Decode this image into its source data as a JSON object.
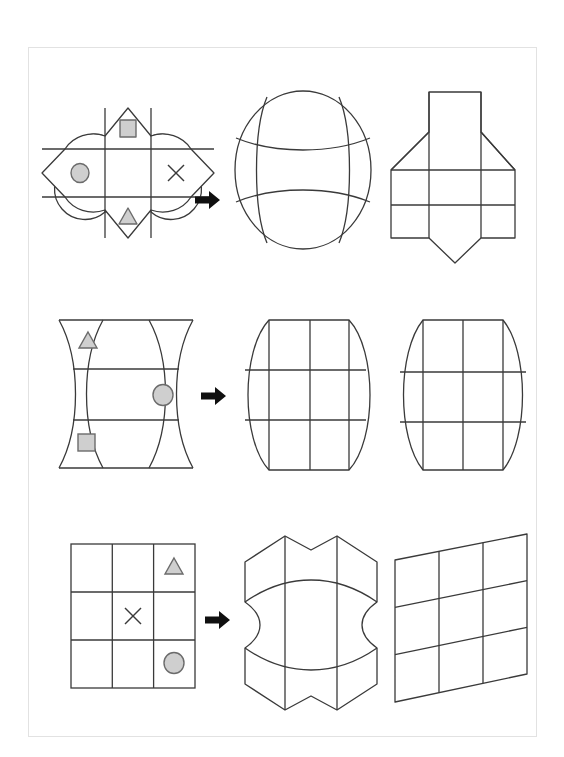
{
  "page": {
    "type": "spatial-reasoning-worksheet",
    "background_color": "#ffffff",
    "sheet_border_color": "#e2e2e2",
    "line_color": "#3a3a3a",
    "symbol_fill_color": "#cfcfcf",
    "symbol_stroke_color": "#6b6b6b",
    "arrow_color": "#101010",
    "row_count": 3,
    "figures_per_row": 3
  },
  "rows": [
    {
      "id": "row-1",
      "net": {
        "name": "four-petal-flower-net",
        "shape_description": "cross net with four rounded petal flaps and pointed top/bottom/left/right tips",
        "grid": "3x3 with rounded outer cells",
        "symbols": [
          {
            "name": "symbol-square",
            "glyph": "square",
            "cell": "top-center",
            "fill": "#cfcfcf"
          },
          {
            "name": "symbol-circle",
            "glyph": "circle",
            "cell": "middle-left",
            "fill": "#cfcfcf"
          },
          {
            "name": "symbol-x",
            "glyph": "x",
            "cell": "middle-right",
            "fill": "none"
          },
          {
            "name": "symbol-triangle",
            "glyph": "triangle",
            "cell": "bottom-center",
            "fill": "#cfcfcf"
          }
        ]
      },
      "arrow": {
        "name": "row1-arrow-icon",
        "direction": "right"
      },
      "options": [
        {
          "label": "A",
          "name": "sphere-ball-figure",
          "shape_description": "ellipse sphere with two vertical and two horizontal curved seams"
        },
        {
          "label": "B",
          "name": "angular-solid-figure",
          "shape_description": "angular polygon solid with vertical column, flared shoulders and pointed base"
        }
      ]
    },
    {
      "id": "row-2",
      "net": {
        "name": "hourglass-curved-net",
        "shape_description": "net of four curved vertical panels pinched at the waist, straight top and bottom edges",
        "grid": "3x3 curved panels",
        "symbols": [
          {
            "name": "symbol-triangle",
            "glyph": "triangle",
            "cell": "top-left",
            "fill": "#cfcfcf"
          },
          {
            "name": "symbol-circle",
            "glyph": "circle",
            "cell": "middle-right",
            "fill": "#cfcfcf"
          },
          {
            "name": "symbol-square",
            "glyph": "square",
            "cell": "bottom-left",
            "fill": "#cfcfcf"
          }
        ]
      },
      "arrow": {
        "name": "row2-arrow-icon",
        "direction": "right"
      },
      "options": [
        {
          "label": "A",
          "name": "rounded-grid-figure",
          "shape_description": "3x3 grid with bulging rounded left and right sides, flat top and bottom"
        },
        {
          "label": "B",
          "name": "barrel-figure",
          "shape_description": "symmetric barrel with 3x3 grid seams, bulged both sides"
        }
      ]
    },
    {
      "id": "row-3",
      "net": {
        "name": "square-grid-net",
        "shape_description": "plain square 3x3 grid",
        "grid": "3x3 squares",
        "symbols": [
          {
            "name": "symbol-triangle",
            "glyph": "triangle",
            "cell": "top-right",
            "fill": "#cfcfcf"
          },
          {
            "name": "symbol-x",
            "glyph": "x",
            "cell": "center",
            "fill": "none"
          },
          {
            "name": "symbol-circle",
            "glyph": "circle",
            "cell": "bottom-right",
            "fill": "#cfcfcf"
          }
        ]
      },
      "arrow": {
        "name": "row3-arrow-icon",
        "direction": "right"
      },
      "options": [
        {
          "label": "A",
          "name": "concave-solid-figure",
          "shape_description": "cube-like solid with concave pinched left and right sides and chamfered top and bottom"
        },
        {
          "label": "B",
          "name": "skewed-grid-figure",
          "shape_description": "3x3 grid skewed in perspective, tilted parallelogram"
        }
      ]
    }
  ],
  "icons": [
    {
      "name": "row1-arrow-icon",
      "glyph": "arrow-right"
    },
    {
      "name": "row2-arrow-icon",
      "glyph": "arrow-right"
    },
    {
      "name": "row3-arrow-icon",
      "glyph": "arrow-right"
    }
  ]
}
